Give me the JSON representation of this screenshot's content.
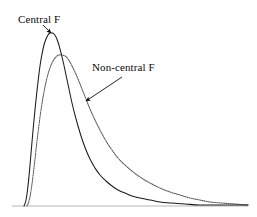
{
  "figure": {
    "background_color": "#ffffff",
    "width": 257,
    "height": 217
  },
  "annotations": {
    "central": {
      "label": "Central F",
      "arrow_from": [
        43,
        25
      ],
      "arrow_to": [
        51,
        33
      ]
    },
    "noncentral": {
      "label": "Non-central F",
      "arrow_from": [
        122,
        77
      ],
      "arrow_to": [
        86,
        101
      ]
    }
  },
  "axis": {
    "baseline_color": "#b8b8b8",
    "baseline_y": 206,
    "baseline_x_start": 12,
    "baseline_x_end": 248
  },
  "chart_data": {
    "type": "line",
    "title": "",
    "xlabel": "",
    "ylabel": "",
    "grid": false,
    "legend_position": "inline-annotation",
    "axis_ticks": false,
    "xlim": [
      0,
      257
    ],
    "ylim": [
      0,
      217
    ],
    "series": [
      {
        "name": "Central F",
        "style": "solid",
        "color": "#1a1a1a",
        "peak": [
          52,
          33
        ],
        "points": [
          [
            24,
            206
          ],
          [
            26,
            200
          ],
          [
            28,
            186
          ],
          [
            30,
            165
          ],
          [
            32,
            142
          ],
          [
            34,
            120
          ],
          [
            36,
            100
          ],
          [
            38,
            82
          ],
          [
            40,
            66
          ],
          [
            42,
            54
          ],
          [
            44,
            45
          ],
          [
            46,
            39
          ],
          [
            48,
            35
          ],
          [
            50,
            33
          ],
          [
            52,
            33
          ],
          [
            54,
            34
          ],
          [
            56,
            37
          ],
          [
            58,
            42
          ],
          [
            60,
            49
          ],
          [
            63,
            61
          ],
          [
            66,
            75
          ],
          [
            69,
            89
          ],
          [
            72,
            103
          ],
          [
            75,
            115
          ],
          [
            78,
            126
          ],
          [
            82,
            139
          ],
          [
            86,
            150
          ],
          [
            90,
            159
          ],
          [
            95,
            168
          ],
          [
            100,
            175
          ],
          [
            106,
            181
          ],
          [
            112,
            186
          ],
          [
            118,
            190
          ],
          [
            125,
            193
          ],
          [
            132,
            196
          ],
          [
            140,
            198
          ],
          [
            150,
            200
          ],
          [
            160,
            202
          ],
          [
            172,
            203
          ],
          [
            185,
            204
          ],
          [
            200,
            205
          ],
          [
            215,
            205
          ],
          [
            230,
            205
          ],
          [
            248,
            205
          ]
        ]
      },
      {
        "name": "Non-central F",
        "style": "dotted",
        "color": "#555555",
        "peak": [
          60,
          55
        ],
        "points": [
          [
            27,
            206
          ],
          [
            29,
            201
          ],
          [
            31,
            191
          ],
          [
            33,
            176
          ],
          [
            35,
            159
          ],
          [
            37,
            141
          ],
          [
            39,
            125
          ],
          [
            41,
            110
          ],
          [
            44,
            92
          ],
          [
            47,
            78
          ],
          [
            50,
            68
          ],
          [
            53,
            61
          ],
          [
            56,
            57
          ],
          [
            59,
            55
          ],
          [
            62,
            55
          ],
          [
            65,
            56
          ],
          [
            68,
            59
          ],
          [
            71,
            64
          ],
          [
            74,
            70
          ],
          [
            78,
            79
          ],
          [
            82,
            89
          ],
          [
            86,
            99
          ],
          [
            90,
            109
          ],
          [
            95,
            120
          ],
          [
            100,
            130
          ],
          [
            106,
            141
          ],
          [
            112,
            150
          ],
          [
            118,
            158
          ],
          [
            125,
            165
          ],
          [
            132,
            171
          ],
          [
            140,
            177
          ],
          [
            150,
            183
          ],
          [
            160,
            188
          ],
          [
            170,
            192
          ],
          [
            180,
            195
          ],
          [
            190,
            198
          ],
          [
            200,
            200
          ],
          [
            210,
            202
          ],
          [
            222,
            203
          ],
          [
            235,
            204
          ],
          [
            248,
            205
          ]
        ]
      }
    ]
  }
}
